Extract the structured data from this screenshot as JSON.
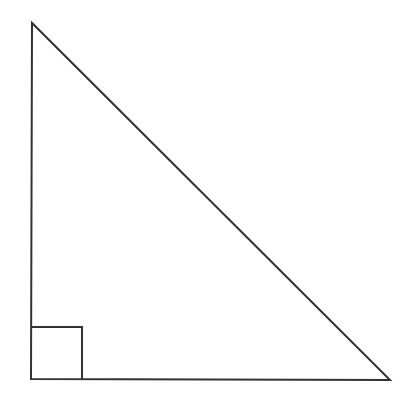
{
  "diagram": {
    "type": "right-triangle",
    "stroke_color": "#333333",
    "background": "#ffffff",
    "vertices": {
      "top": [
        32,
        23
      ],
      "bottom_left": [
        31,
        379
      ],
      "bottom_right": [
        390,
        380
      ]
    },
    "right_angle_marker": {
      "at": "bottom_left",
      "size": 51
    },
    "labels": []
  }
}
